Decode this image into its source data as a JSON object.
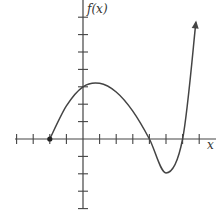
{
  "chart_data": {
    "type": "line",
    "title": "",
    "xlabel": "x",
    "ylabel": "f(x)",
    "xlim": [
      -4,
      7
    ],
    "ylim": [
      -4,
      7
    ],
    "x_ticks": [
      -4,
      -3,
      -2,
      -1,
      1,
      2,
      3,
      4,
      5,
      6,
      7
    ],
    "y_ticks": [
      -4,
      -3,
      -2,
      -1,
      1,
      2,
      3,
      4,
      5,
      6,
      7
    ],
    "tick_labels_shown": false,
    "grid": false,
    "series": [
      {
        "name": "f(x)",
        "start_point": {
          "x": -2,
          "y": 0,
          "closed_dot": true
        },
        "end_arrow": true,
        "points": [
          {
            "x": -2,
            "y": 0
          },
          {
            "x": -1,
            "y": 1.9
          },
          {
            "x": 0,
            "y": 3
          },
          {
            "x": 1,
            "y": 3.2
          },
          {
            "x": 2,
            "y": 2.7
          },
          {
            "x": 3,
            "y": 1.6
          },
          {
            "x": 4,
            "y": 0
          },
          {
            "x": 5,
            "y": -1.95
          },
          {
            "x": 6,
            "y": 0
          },
          {
            "x": 6.8,
            "y": 6.7
          }
        ],
        "zeros": [
          -2,
          4,
          6
        ],
        "local_max": {
          "x": 1,
          "y": 3.2
        },
        "local_min": {
          "x": 5,
          "y": -2
        },
        "y_intercept": 3
      }
    ]
  },
  "labels": {
    "y_axis": "f(x)",
    "x_axis": "x"
  }
}
